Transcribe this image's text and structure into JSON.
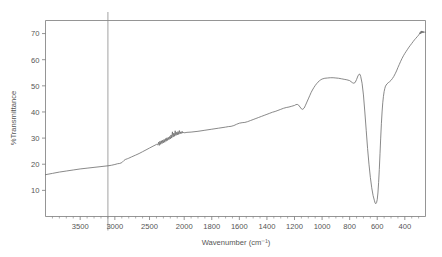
{
  "chart_data": {
    "type": "line",
    "title": "",
    "subtitle": "",
    "xlabel": "Wavenumber (cm⁻¹)",
    "ylabel": "%Transmittance",
    "grid": false,
    "legend": null,
    "xaxis": {
      "reversed": true,
      "piecewise": true,
      "range": [
        4000,
        250
      ],
      "break_at": 2000,
      "major_ticks": [
        3500,
        3000,
        2500,
        2000,
        1800,
        1600,
        1400,
        1200,
        1000,
        800,
        600,
        400
      ],
      "major_tick_labels": [
        "3500",
        "3000",
        "2500",
        "2000",
        "1800",
        "1600",
        "1400",
        "1200",
        "1000",
        "800",
        "600",
        "400"
      ],
      "minor_tick_step_high": 100,
      "minor_tick_step_low": 50
    },
    "yaxis": {
      "range": [
        0,
        75
      ],
      "major_ticks": [
        10,
        20,
        30,
        40,
        50,
        60,
        70
      ],
      "major_tick_labels": [
        "10",
        "20",
        "30",
        "40",
        "50",
        "60",
        "70"
      ]
    },
    "annotations": [
      {
        "name": "cursor-line",
        "type": "vline",
        "x": 3100,
        "label": ""
      },
      {
        "name": "noise-band-co2",
        "type": "region",
        "x_start": 2400,
        "x_end": 2000,
        "label": ""
      }
    ],
    "series": [
      {
        "name": "IR transmittance",
        "color": "#6b6b6b",
        "points": [
          [
            4000,
            16.0
          ],
          [
            3900,
            16.5
          ],
          [
            3800,
            17.0
          ],
          [
            3700,
            17.4
          ],
          [
            3600,
            17.8
          ],
          [
            3500,
            18.2
          ],
          [
            3400,
            18.5
          ],
          [
            3300,
            18.8
          ],
          [
            3200,
            19.1
          ],
          [
            3100,
            19.4
          ],
          [
            3050,
            19.6
          ],
          [
            3000,
            19.9
          ],
          [
            2960,
            20.2
          ],
          [
            2930,
            20.3
          ],
          [
            2900,
            20.6
          ],
          [
            2870,
            21.4
          ],
          [
            2850,
            21.8
          ],
          [
            2820,
            22.1
          ],
          [
            2800,
            22.3
          ],
          [
            2760,
            22.8
          ],
          [
            2700,
            23.5
          ],
          [
            2650,
            24.1
          ],
          [
            2600,
            24.8
          ],
          [
            2550,
            25.5
          ],
          [
            2500,
            26.2
          ],
          [
            2450,
            26.9
          ],
          [
            2420,
            27.3
          ],
          [
            2400,
            27.6
          ],
          [
            2380,
            27.4
          ],
          [
            2370,
            28.4
          ],
          [
            2360,
            27.2
          ],
          [
            2350,
            28.8
          ],
          [
            2340,
            27.6
          ],
          [
            2330,
            29.0
          ],
          [
            2320,
            27.9
          ],
          [
            2310,
            29.2
          ],
          [
            2300,
            28.2
          ],
          [
            2290,
            29.5
          ],
          [
            2280,
            28.4
          ],
          [
            2270,
            29.8
          ],
          [
            2260,
            28.8
          ],
          [
            2250,
            30.1
          ],
          [
            2240,
            29.1
          ],
          [
            2230,
            30.3
          ],
          [
            2220,
            29.4
          ],
          [
            2210,
            30.6
          ],
          [
            2200,
            29.7
          ],
          [
            2190,
            31.2
          ],
          [
            2180,
            30.0
          ],
          [
            2170,
            32.4
          ],
          [
            2160,
            30.4
          ],
          [
            2150,
            31.9
          ],
          [
            2140,
            30.7
          ],
          [
            2130,
            32.8
          ],
          [
            2120,
            31.0
          ],
          [
            2110,
            32.2
          ],
          [
            2100,
            31.2
          ],
          [
            2090,
            32.5
          ],
          [
            2080,
            31.4
          ],
          [
            2070,
            32.9
          ],
          [
            2060,
            31.6
          ],
          [
            2050,
            32.4
          ],
          [
            2040,
            31.8
          ],
          [
            2030,
            32.6
          ],
          [
            2020,
            31.9
          ],
          [
            2010,
            32.3
          ],
          [
            2000,
            32.0
          ],
          [
            1980,
            32.2
          ],
          [
            1950,
            32.3
          ],
          [
            1900,
            32.6
          ],
          [
            1850,
            33.0
          ],
          [
            1800,
            33.4
          ],
          [
            1750,
            33.8
          ],
          [
            1700,
            34.2
          ],
          [
            1680,
            34.4
          ],
          [
            1660,
            34.5
          ],
          [
            1640,
            34.8
          ],
          [
            1620,
            35.3
          ],
          [
            1600,
            35.7
          ],
          [
            1580,
            35.9
          ],
          [
            1560,
            36.0
          ],
          [
            1540,
            36.3
          ],
          [
            1520,
            36.7
          ],
          [
            1500,
            37.1
          ],
          [
            1480,
            37.5
          ],
          [
            1460,
            37.9
          ],
          [
            1440,
            38.3
          ],
          [
            1420,
            38.7
          ],
          [
            1400,
            39.1
          ],
          [
            1380,
            39.5
          ],
          [
            1360,
            39.9
          ],
          [
            1340,
            40.2
          ],
          [
            1320,
            40.6
          ],
          [
            1300,
            41.0
          ],
          [
            1280,
            41.4
          ],
          [
            1260,
            41.7
          ],
          [
            1240,
            41.9
          ],
          [
            1220,
            42.2
          ],
          [
            1200,
            42.5
          ],
          [
            1190,
            42.8
          ],
          [
            1180,
            42.9
          ],
          [
            1170,
            42.6
          ],
          [
            1160,
            41.9
          ],
          [
            1150,
            41.2
          ],
          [
            1140,
            41.0
          ],
          [
            1130,
            41.5
          ],
          [
            1120,
            42.6
          ],
          [
            1110,
            43.8
          ],
          [
            1100,
            45.0
          ],
          [
            1090,
            46.2
          ],
          [
            1080,
            47.4
          ],
          [
            1070,
            48.4
          ],
          [
            1060,
            49.3
          ],
          [
            1050,
            50.1
          ],
          [
            1040,
            50.8
          ],
          [
            1030,
            51.4
          ],
          [
            1020,
            51.9
          ],
          [
            1010,
            52.3
          ],
          [
            1000,
            52.6
          ],
          [
            980,
            52.9
          ],
          [
            960,
            53.0
          ],
          [
            940,
            53.1
          ],
          [
            920,
            53.1
          ],
          [
            900,
            53.0
          ],
          [
            880,
            52.9
          ],
          [
            860,
            52.7
          ],
          [
            840,
            52.5
          ],
          [
            820,
            52.3
          ],
          [
            800,
            52.0
          ],
          [
            790,
            51.6
          ],
          [
            780,
            51.2
          ],
          [
            770,
            51.0
          ],
          [
            760,
            51.3
          ],
          [
            750,
            52.4
          ],
          [
            740,
            53.8
          ],
          [
            730,
            54.5
          ],
          [
            725,
            54.4
          ],
          [
            720,
            53.6
          ],
          [
            710,
            51.0
          ],
          [
            700,
            46.5
          ],
          [
            690,
            40.0
          ],
          [
            680,
            33.0
          ],
          [
            670,
            26.0
          ],
          [
            660,
            20.0
          ],
          [
            650,
            15.0
          ],
          [
            640,
            11.0
          ],
          [
            630,
            8.0
          ],
          [
            620,
            6.0
          ],
          [
            615,
            5.1
          ],
          [
            610,
            4.9
          ],
          [
            605,
            5.3
          ],
          [
            600,
            6.5
          ],
          [
            595,
            9.0
          ],
          [
            590,
            13.0
          ],
          [
            585,
            18.0
          ],
          [
            580,
            24.0
          ],
          [
            575,
            30.0
          ],
          [
            570,
            35.5
          ],
          [
            565,
            40.0
          ],
          [
            560,
            43.5
          ],
          [
            555,
            46.0
          ],
          [
            550,
            47.8
          ],
          [
            545,
            49.0
          ],
          [
            540,
            49.9
          ],
          [
            530,
            50.7
          ],
          [
            520,
            51.2
          ],
          [
            510,
            51.6
          ],
          [
            500,
            52.1
          ],
          [
            490,
            52.8
          ],
          [
            480,
            53.6
          ],
          [
            470,
            54.6
          ],
          [
            460,
            55.7
          ],
          [
            450,
            57.0
          ],
          [
            440,
            58.2
          ],
          [
            430,
            59.4
          ],
          [
            420,
            60.5
          ],
          [
            410,
            61.5
          ],
          [
            400,
            62.4
          ],
          [
            390,
            63.2
          ],
          [
            380,
            64.0
          ],
          [
            370,
            64.8
          ],
          [
            360,
            65.5
          ],
          [
            350,
            66.2
          ],
          [
            340,
            66.9
          ],
          [
            330,
            67.6
          ],
          [
            320,
            68.2
          ],
          [
            310,
            68.8
          ],
          [
            300,
            69.4
          ],
          [
            295,
            69.8
          ],
          [
            290,
            70.4
          ],
          [
            287,
            69.9
          ],
          [
            284,
            70.8
          ],
          [
            281,
            70.1
          ],
          [
            278,
            71.0
          ],
          [
            275,
            70.3
          ],
          [
            272,
            70.9
          ],
          [
            268,
            70.2
          ],
          [
            264,
            70.8
          ],
          [
            260,
            70.4
          ],
          [
            255,
            70.7
          ],
          [
            250,
            70.5
          ]
        ]
      }
    ]
  },
  "colors": {
    "curve": "#6b6b6b",
    "axis": "#7a7a7a",
    "text": "#555555",
    "cursor": "#8a8a8a",
    "background": "#ffffff"
  }
}
